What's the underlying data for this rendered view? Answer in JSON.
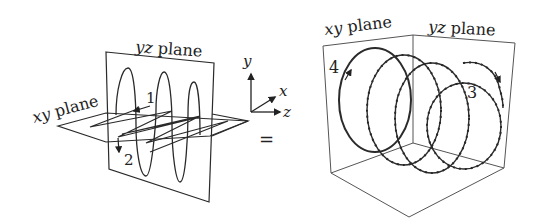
{
  "left_figure": {
    "yz_plane_label": {
      "italic": "yz",
      "rest": " plane"
    },
    "xy_plane_label": {
      "italic": "xy",
      "rest": " plane"
    },
    "marker_1": "1",
    "marker_2": "2"
  },
  "axes": {
    "y": "y",
    "x": "x",
    "z": "z"
  },
  "equals": "=",
  "right_figure": {
    "xy_plane_label": {
      "italic": "xy",
      "rest": " plane"
    },
    "yz_plane_label": {
      "italic": "yz",
      "rest": " plane"
    },
    "marker_3": "3",
    "marker_4": "4"
  },
  "colors": {
    "line": "#2a2a2a",
    "box": "#555555",
    "background": "#ffffff"
  }
}
